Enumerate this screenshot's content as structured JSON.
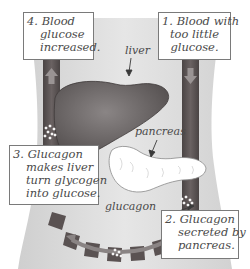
{
  "diagram": {
    "steps": [
      {
        "number": "1.",
        "lines": [
          "Blood with",
          "too little",
          "glucose."
        ]
      },
      {
        "number": "2.",
        "lines": [
          "Glucagon",
          "secreted by",
          "pancreas."
        ]
      },
      {
        "number": "3.",
        "lines": [
          "Glucagon",
          "makes liver",
          "turn glycogen",
          "into glucose."
        ]
      },
      {
        "number": "4.",
        "lines": [
          "Blood",
          "glucose",
          "increased."
        ]
      }
    ],
    "labels": {
      "liver": "liver",
      "pancreas": "pancreas",
      "glucagon": "glucagon"
    },
    "colors": {
      "body_silhouette": "#dcdcdc",
      "blood_vessel": "#5a5252",
      "vessel_arrow": "#9a9494",
      "liver": "#6e6969",
      "pancreas": "#ffffff",
      "glucagon_dots": "#ffffff",
      "box_border": "#7a7a7a",
      "text": "#4a4a4a"
    }
  }
}
